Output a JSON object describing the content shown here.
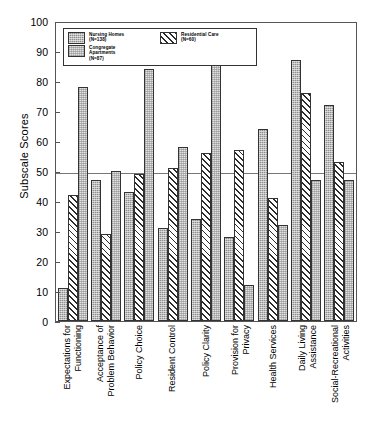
{
  "chart_data": {
    "type": "bar",
    "title": "",
    "xlabel": "",
    "ylabel": "Subscale Scores",
    "ylim": [
      0,
      100
    ],
    "yticks": [
      0,
      10,
      20,
      30,
      40,
      50,
      60,
      70,
      80,
      90,
      100
    ],
    "grid": false,
    "reference_line": 50,
    "legend_position": "upper-left",
    "categories": [
      "Expectations for Functioning",
      "Acceptance of Problem Behavior",
      "Policy Choice",
      "Resident Control",
      "Policy Clarity",
      "Provision for Privacy",
      "Health Services",
      "Daily Living Assistance",
      "Social-Recreational Activities"
    ],
    "series": [
      {
        "name": "Nursing Homes",
        "n": 138,
        "fill": "solid-gray",
        "values": [
          11,
          47,
          43,
          31,
          34,
          28,
          64,
          87,
          72
        ]
      },
      {
        "name": "Residential Care",
        "n": 60,
        "fill": "diagonal-hatch",
        "values": [
          42,
          29,
          49,
          51,
          56,
          57,
          41,
          76,
          53
        ]
      },
      {
        "name": "Congregate Apartments",
        "n": 87,
        "fill": "light-dotted",
        "values": [
          78,
          50,
          84,
          58,
          93,
          12,
          32,
          47,
          47
        ]
      }
    ]
  },
  "legend": {
    "entries": [
      {
        "label": "Nursing Homes",
        "n_label": "(N=138)",
        "swatch": "nursing-homes-swatch"
      },
      {
        "label": "Congregate",
        "label2": "Apartments",
        "n_label": "(N=87)",
        "swatch": "congregate-apartments-swatch"
      },
      {
        "label": "Residential Care",
        "n_label": "(N=60)",
        "swatch": "residential-care-swatch"
      }
    ]
  },
  "axis": {
    "y_title": "Subscale Scores",
    "y_ticks": [
      "100",
      "90",
      "80",
      "70",
      "60",
      "50",
      "40",
      "30",
      "20",
      "10",
      "0"
    ]
  },
  "x_labels": [
    {
      "line1": "Expectations for",
      "line2": "Functioning"
    },
    {
      "line1": "Acceptance of",
      "line2": "Problem Behavior"
    },
    {
      "line1": "Policy Choice",
      "line2": ""
    },
    {
      "line1": "Resident Control",
      "line2": ""
    },
    {
      "line1": "Policy Clarity",
      "line2": ""
    },
    {
      "line1": "Provision for",
      "line2": "Privacy"
    },
    {
      "line1": "Health Services",
      "line2": ""
    },
    {
      "line1": "Daily Living",
      "line2": "Assistance"
    },
    {
      "line1": "Social-Recreational",
      "line2": "Activities"
    }
  ],
  "caption": ""
}
